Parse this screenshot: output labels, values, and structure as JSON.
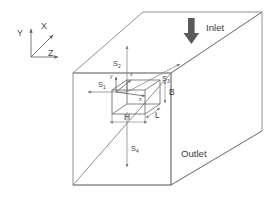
{
  "figure": {
    "background_color": "#ffffff",
    "line_color": "#7d7d7d",
    "text_color": "#3a3a3a",
    "arrow_fill": "#5a5a5a"
  },
  "global_axes": {
    "name": "global-coordinate-system",
    "x_label": "X",
    "y_label": "Y",
    "z_label": "Z"
  },
  "local_axes": {
    "name": "local-coordinate-system",
    "x_label": "x",
    "y_label": "y",
    "z_label": "z"
  },
  "flow": {
    "inlet_label": "Inlet",
    "outlet_label": "Outlet",
    "inlet_direction": "down"
  },
  "block_dimensions": {
    "width_label": "H",
    "height_label": "B",
    "depth_label": "L"
  },
  "stations": [
    {
      "id": "s1",
      "base": "S",
      "sub": "1",
      "label": "S1",
      "position": "left",
      "direction": "left"
    },
    {
      "id": "s2",
      "base": "S",
      "sub": "2",
      "label": "S2",
      "position": "top",
      "direction": "up"
    },
    {
      "id": "s3",
      "base": "S",
      "sub": "3",
      "label": "S3",
      "position": "right",
      "direction": "up-right"
    },
    {
      "id": "s4",
      "base": "S",
      "sub": "4",
      "label": "S4",
      "position": "bottom",
      "direction": "down"
    }
  ]
}
